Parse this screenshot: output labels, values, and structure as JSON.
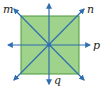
{
  "diagram": {
    "type": "square-lines-of-symmetry",
    "square": {
      "fill": "#9fd28a",
      "stroke": "#4a9a3c"
    },
    "line_color": "#2f6fb0",
    "lines": [
      {
        "name": "m",
        "label": "m",
        "direction": "diagonal-down-right"
      },
      {
        "name": "n",
        "label": "n",
        "direction": "diagonal-up-right"
      },
      {
        "name": "p",
        "label": "p",
        "direction": "horizontal"
      },
      {
        "name": "q",
        "label": "q",
        "direction": "vertical"
      }
    ]
  },
  "labels": {
    "m": "m",
    "n": "n",
    "p": "p",
    "q": "q"
  }
}
